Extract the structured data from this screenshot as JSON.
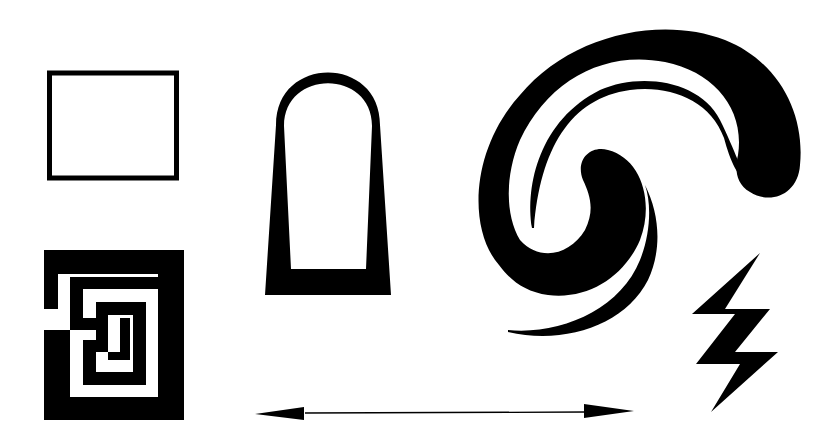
{
  "page": {
    "background": "#ffffff",
    "ink": "#000000"
  },
  "shapes": [
    {
      "id": "rectangle",
      "label": "Outlined rectangle"
    },
    {
      "id": "maze",
      "label": "Square maze"
    },
    {
      "id": "arch",
      "label": "Arch / tombstone outline"
    },
    {
      "id": "spiral",
      "label": "Hook spiral with crescents"
    },
    {
      "id": "lightning",
      "label": "Lightning bolt"
    },
    {
      "id": "double-arrow",
      "label": "Double-headed arrow"
    }
  ]
}
